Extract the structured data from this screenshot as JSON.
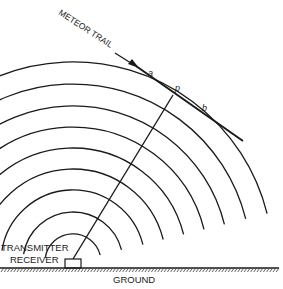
{
  "diagram": {
    "labels": {
      "meteor_trail": "METEOR TRAIL",
      "point_a": "a",
      "point_p": "p",
      "point_b": "b",
      "transmitter": "TRANSMITTER",
      "receiver": "RECEIVER",
      "ground": "GROUND"
    },
    "station": {
      "x": 73,
      "y": 262
    },
    "wavefront_radii": [
      200,
      178,
      156,
      135,
      114,
      93,
      72,
      50,
      28
    ],
    "colors": {
      "ink": "#1a1a1a",
      "background": "#ffffff"
    }
  }
}
